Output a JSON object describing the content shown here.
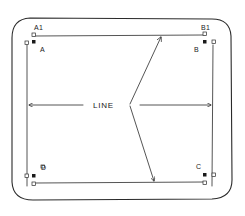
{
  "diagram": {
    "labels": {
      "a1": "A1",
      "a": "A",
      "b1": "B1",
      "b": "B",
      "c": "C",
      "d": "D",
      "line": "LINE"
    },
    "colors": {
      "ink": "#2a2a2a",
      "background": "#ffffff"
    }
  }
}
